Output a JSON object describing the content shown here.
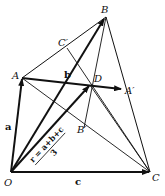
{
  "figure": {
    "points": {
      "O": {
        "label": "O",
        "x": 11,
        "y": 172
      },
      "A": {
        "label": "A",
        "x": 22,
        "y": 78
      },
      "B": {
        "label": "B",
        "x": 106,
        "y": 17
      },
      "C": {
        "label": "C",
        "x": 150,
        "y": 172
      },
      "D": {
        "label": "D",
        "x": 90,
        "y": 85
      },
      "A_prime": {
        "label": "A′",
        "x": 122,
        "y": 89
      },
      "B_prime": {
        "label": "B′",
        "x": 84,
        "y": 128
      },
      "C_prime": {
        "label": "C′",
        "x": 67,
        "y": 48
      }
    },
    "vectors": {
      "a": "a",
      "b": "b",
      "c": "c"
    },
    "formula": {
      "numerator": "r = a+b+c",
      "denominator": "3"
    },
    "colors": {
      "line": "#111111",
      "background": "#ffffff"
    }
  }
}
